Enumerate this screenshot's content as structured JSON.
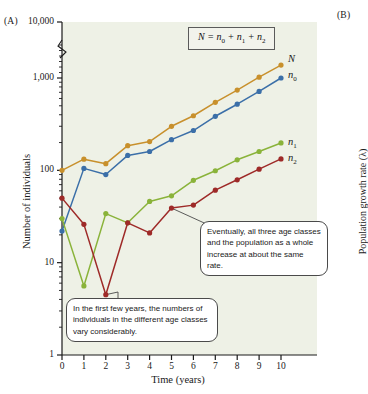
{
  "panels": {
    "a_label": "(A)",
    "b_label": "(B)",
    "b_axis_title": "Population growth rate (λ)"
  },
  "equation": {
    "lhs": "N",
    "eq": " = ",
    "t0": "n",
    "t0sub": "0",
    "p1": " + ",
    "t1": "n",
    "t1sub": "1",
    "p2": " + ",
    "t2": "n",
    "t2sub": "2"
  },
  "annotations": {
    "bottom": "In the first few years, the numbers of individuals in the different age classes vary considerably.",
    "top": "Eventually, all three age classes and the population as a whole increase at about the same rate."
  },
  "series_labels": {
    "N": "N",
    "n0_base": "n",
    "n0_sub": "0",
    "n1_base": "n",
    "n1_sub": "1",
    "n2_base": "n",
    "n2_sub": "2"
  },
  "colors": {
    "N": "#c8902c",
    "n0": "#3b6fa8",
    "n1": "#8ab33a",
    "n2": "#9e2a28",
    "plot_bg": "#eef1e6",
    "axis": "#1a1a1a",
    "callout_border": "#4a4a4a"
  },
  "chart_data": {
    "type": "line",
    "title": "",
    "xlabel": "Time (years)",
    "ylabel": "Number of individuals",
    "yscale": "log",
    "ylim": [
      1,
      10000
    ],
    "xlim": [
      0,
      10
    ],
    "axis_break": true,
    "axis_break_between": [
      1000,
      10000
    ],
    "grid": false,
    "legend_position": "right-inline",
    "ytick_labels": [
      "10,000",
      "1,000",
      "100",
      "10",
      "1"
    ],
    "ytick_values": [
      10000,
      1000,
      100,
      10,
      1
    ],
    "xtick_labels": [
      "0",
      "1",
      "2",
      "3",
      "4",
      "5",
      "6",
      "7",
      "8",
      "9",
      "10"
    ],
    "x": [
      0,
      1,
      2,
      3,
      4,
      5,
      6,
      7,
      8,
      9,
      10
    ],
    "series": [
      {
        "name": "N",
        "color": "#c8902c",
        "values": [
          100,
          132,
          118,
          185,
          205,
          300,
          390,
          545,
          740,
          1020,
          1380
        ]
      },
      {
        "name": "n0",
        "color": "#3b6fa8",
        "values": [
          22,
          105,
          90,
          145,
          160,
          215,
          270,
          385,
          520,
          715,
          1000
        ]
      },
      {
        "name": "n1",
        "color": "#8ab33a",
        "values": [
          30,
          5.6,
          34,
          27,
          46,
          53,
          78,
          99,
          130,
          160,
          198
        ]
      },
      {
        "name": "n2",
        "color": "#9e2a28",
        "values": [
          50,
          26,
          4.5,
          27,
          21,
          39,
          42,
          61,
          79,
          103,
          133
        ]
      }
    ]
  }
}
